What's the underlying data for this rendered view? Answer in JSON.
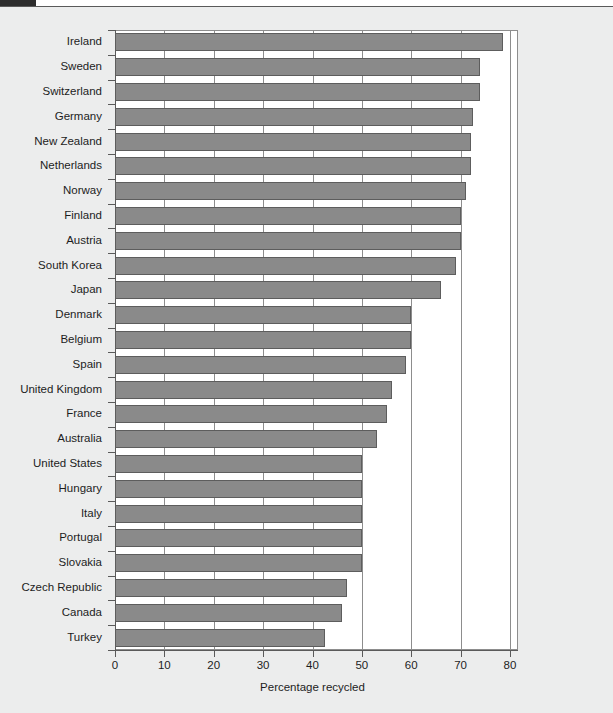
{
  "header": {
    "tab_label": "",
    "strip_label": ""
  },
  "chart_data": {
    "type": "bar",
    "orientation": "horizontal",
    "title": "",
    "subtitle": "",
    "xlabel": "Percentage recycled",
    "ylabel": "",
    "xlim": [
      0,
      80
    ],
    "xticks": [
      0,
      10,
      20,
      30,
      40,
      50,
      60,
      70,
      80
    ],
    "xticklabels": [
      "0",
      "10",
      "20",
      "30",
      "40",
      "50",
      "60",
      "70",
      "80"
    ],
    "grid": true,
    "grid_axis": "x",
    "legend": null,
    "bar_color": "#8a8a8a",
    "bar_edge_color": "#5d5d5d",
    "plot_background": "#ffffff",
    "figure_background": "#eceded",
    "categories": [
      "Ireland",
      "Sweden",
      "Switzerland",
      "Germany",
      "New Zealand",
      "Netherlands",
      "Norway",
      "Finland",
      "Austria",
      "South Korea",
      "Japan",
      "Denmark",
      "Belgium",
      "Spain",
      "United Kingdom",
      "France",
      "Australia",
      "United States",
      "Hungary",
      "Italy",
      "Portugal",
      "Slovakia",
      "Czech Republic",
      "Canada",
      "Turkey"
    ],
    "values": [
      78.5,
      74.0,
      74.0,
      72.5,
      72.0,
      72.0,
      71.0,
      70.0,
      70.0,
      69.0,
      66.0,
      60.0,
      60.0,
      59.0,
      56.0,
      55.0,
      53.0,
      50.0,
      50.0,
      50.0,
      50.0,
      50.0,
      47.0,
      46.0,
      42.5
    ]
  }
}
